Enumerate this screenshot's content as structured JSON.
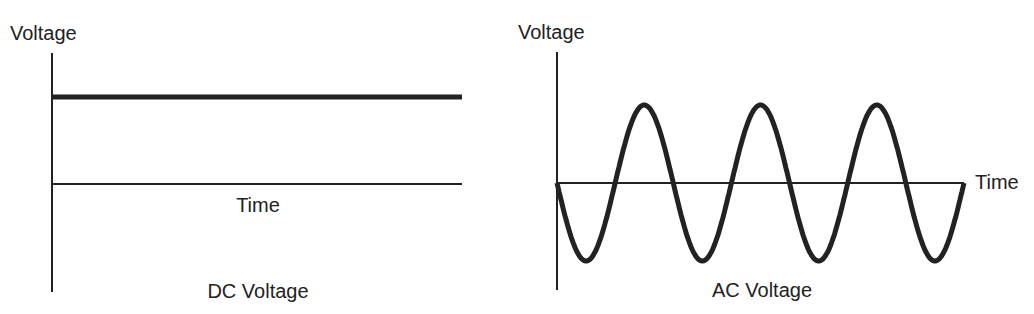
{
  "left_panel": {
    "y_axis_label": "Voltage",
    "x_axis_label": "Time",
    "caption": "DC Voltage"
  },
  "right_panel": {
    "y_axis_label": "Voltage",
    "x_axis_label": "Time",
    "caption": "AC Voltage"
  },
  "colors": {
    "line": "#222222",
    "background": "#ffffff"
  },
  "chart_data": [
    {
      "type": "line",
      "title": "DC Voltage",
      "xlabel": "Time",
      "ylabel": "Voltage",
      "series": [
        {
          "name": "DC voltage",
          "shape": "constant",
          "level": 1.0
        }
      ],
      "grid": false
    },
    {
      "type": "line",
      "title": "AC Voltage",
      "xlabel": "Time",
      "ylabel": "Voltage",
      "series": [
        {
          "name": "AC voltage",
          "shape": "sine",
          "cycles": 3.5,
          "start_direction": "negative",
          "amplitude": 1.0
        }
      ],
      "grid": false
    }
  ]
}
